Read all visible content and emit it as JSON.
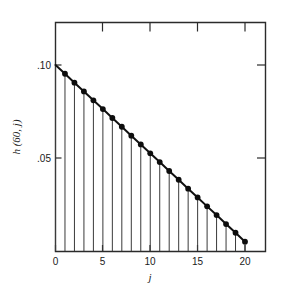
{
  "figure": {
    "background_color": "#ffffff",
    "foreground_color": "#1a1a1a"
  },
  "axes": {
    "x_title": "j",
    "y_title": "h (60, j)",
    "x_ticks": [
      "0",
      "5",
      "10",
      "15",
      "20"
    ],
    "y_ticks": [
      ".10",
      ".05"
    ]
  },
  "chart_data": {
    "type": "line",
    "title": "",
    "subtitle": "",
    "xlabel": "j",
    "ylabel": "h (60, j)",
    "xlim": [
      0,
      25
    ],
    "ylim": [
      0,
      0.115
    ],
    "xticks": [
      0,
      5,
      10,
      15,
      20
    ],
    "xticklabels": [
      "0",
      "5",
      "10",
      "15",
      "20"
    ],
    "yticks": [
      0.1,
      0.05
    ],
    "yticklabels": [
      ".10",
      ".05"
    ],
    "grid": false,
    "legend": null,
    "legend_position": "none",
    "frame": "box",
    "tick_direction": "in",
    "top_axis_ticks": [
      5,
      10,
      15,
      20
    ],
    "right_axis_ticks": [
      0.1,
      0.05
    ],
    "marker": "filled-circle",
    "series": [
      {
        "name": "h(60, j)",
        "style": "stem-with-envelope",
        "x": [
          0,
          1,
          2,
          3,
          4,
          5,
          6,
          7,
          8,
          9,
          10,
          11,
          12,
          13,
          14,
          15,
          16,
          17,
          18,
          19,
          20
        ],
        "values": [
          0.1,
          0.0953,
          0.0905,
          0.0858,
          0.081,
          0.0763,
          0.0715,
          0.0668,
          0.062,
          0.0573,
          0.0525,
          0.0478,
          0.043,
          0.0383,
          0.0335,
          0.0288,
          0.024,
          0.0193,
          0.0145,
          0.0098,
          0.005
        ]
      }
    ],
    "annotations": []
  }
}
